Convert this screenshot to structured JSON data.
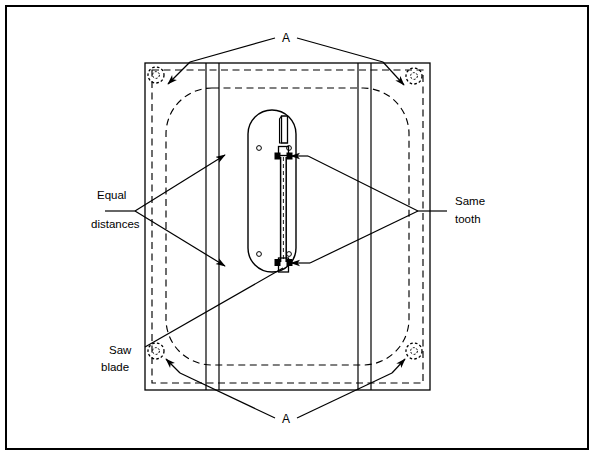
{
  "figure": {
    "domain": "technical-line-diagram",
    "background_color": "#ffffff",
    "line_color": "#000000",
    "border": {
      "name": "figure-border",
      "x": 6,
      "y": 6,
      "width": 582,
      "height": 443,
      "stroke_width": 2
    },
    "panel": {
      "name": "panel-outline",
      "x": 145,
      "y": 63,
      "width": 285,
      "height": 327,
      "stroke_width": 1.4,
      "style": "solid"
    },
    "inner_dashed_rect": {
      "name": "panel-inner-dashed-rect",
      "x": 152,
      "y": 70,
      "width": 271,
      "height": 313,
      "style": "dashed"
    },
    "rounded_dashed_outline": {
      "name": "cutout-rounded-dashed-outline",
      "x": 166,
      "y": 88,
      "width": 243,
      "height": 277,
      "corner_radius": 46,
      "style": "dashed"
    },
    "vertical_lines": [
      {
        "name": "guide-line-left-outer",
        "x": 206,
        "y1": 63,
        "y2": 390
      },
      {
        "name": "guide-line-left-inner",
        "x": 219,
        "y1": 63,
        "y2": 390
      },
      {
        "name": "guide-line-right-inner",
        "x": 358,
        "y1": 63,
        "y2": 390
      },
      {
        "name": "guide-line-right-outer",
        "x": 371,
        "y1": 63,
        "y2": 390
      }
    ],
    "screws": [
      {
        "name": "screw-top-left",
        "cx": 156,
        "cy": 75,
        "r": 8
      },
      {
        "name": "screw-top-right",
        "cx": 414,
        "cy": 76,
        "r": 8
      },
      {
        "name": "screw-bottom-left",
        "cx": 156,
        "cy": 351,
        "r": 8
      },
      {
        "name": "screw-bottom-right",
        "cx": 414,
        "cy": 351,
        "r": 8
      }
    ],
    "saw_shoe": {
      "name": "saw-shoe-stadium",
      "x": 248,
      "y": 110,
      "width": 48,
      "height": 162,
      "corner_radius": 24,
      "blade_slot_x": 282,
      "blade_top_y": 128,
      "blade_bottom_y": 262,
      "pivot_holes": [
        {
          "name": "pivot-hole-top-left",
          "cx": 259,
          "cy": 148,
          "r": 2.4
        },
        {
          "name": "pivot-hole-top-right",
          "cx": 289,
          "cy": 148,
          "r": 2.4
        },
        {
          "name": "pivot-hole-bottom-left",
          "cx": 259,
          "cy": 254,
          "r": 2.4
        },
        {
          "name": "pivot-hole-bottom-right",
          "cx": 289,
          "cy": 254,
          "r": 2.4
        }
      ],
      "tooth_marker_top_y": 156,
      "tooth_marker_bottom_y": 262
    },
    "labels": {
      "a_top": "A",
      "a_bottom": "A",
      "equal_distances_line1": "Equal",
      "equal_distances_line2": "distances",
      "same_tooth_line1": "Same",
      "same_tooth_line2": "tooth",
      "saw_blade_line1": "Saw",
      "saw_blade_line2": "blade"
    },
    "leaders": {
      "a_top_text_pos": {
        "x": 285,
        "y": 42
      },
      "a_bottom_text_pos": {
        "x": 285,
        "y": 423
      },
      "equal_distances_pos": {
        "x": 97,
        "y": 199
      },
      "same_tooth_pos": {
        "x": 455,
        "y": 205
      },
      "saw_blade_pos": {
        "x": 106,
        "y": 354
      }
    }
  }
}
